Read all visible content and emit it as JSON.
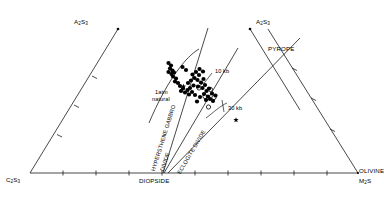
{
  "figure": {
    "type": "ternary-phase-diagram",
    "background": "#ffffff",
    "line_color": "#1a1a1a",
    "point_color": "#000000"
  },
  "apices": {
    "left_top": "A2S3",
    "left_top_html": "A₂S₃",
    "right_top": "A2S3",
    "right_top_html": "A₂S₃",
    "bottom_left": "C2S3",
    "bottom_left_html": "C₂S₃",
    "bottom_right_mineral": "OLIVINE",
    "bottom_right_formula": "M2S",
    "bottom_right_formula_html": "M₂S",
    "bottom_center": "DIOPSIDE"
  },
  "annotations": {
    "pyrope": "PYROPE",
    "divide_hypersthene": "HYPERSTHENE GABBRO",
    "divide_hypersthene_2": "DIVIDE",
    "divide_eclogite": "ECLOGITE  DIVIDE",
    "natural_line1": "1atm",
    "natural_line2": "natural",
    "pressure_10kb": "10 kb",
    "pressure_30kb": "30 kb"
  },
  "chart_data": {
    "type": "scatter",
    "title": "",
    "xlabel": "",
    "ylabel": "",
    "grid": false,
    "legend": "none",
    "filled_points": [
      [
        168.5,
        63.0
      ],
      [
        171.0,
        65.5
      ],
      [
        170.0,
        68.5
      ],
      [
        172.5,
        70.5
      ],
      [
        168.5,
        72.0
      ],
      [
        171.5,
        74.0
      ],
      [
        174.0,
        72.5
      ],
      [
        173.0,
        76.5
      ],
      [
        176.0,
        78.5
      ],
      [
        175.0,
        81.5
      ],
      [
        178.0,
        83.0
      ],
      [
        180.0,
        86.0
      ],
      [
        183.0,
        88.5
      ],
      [
        181.0,
        91.0
      ],
      [
        185.0,
        92.5
      ],
      [
        187.5,
        90.0
      ],
      [
        189.0,
        94.5
      ],
      [
        192.0,
        92.0
      ],
      [
        190.0,
        88.0
      ],
      [
        193.5,
        85.5
      ],
      [
        188.0,
        83.0
      ],
      [
        191.0,
        80.5
      ],
      [
        194.5,
        78.0
      ],
      [
        192.5,
        74.5
      ],
      [
        196.0,
        72.0
      ],
      [
        199.0,
        75.0
      ],
      [
        197.5,
        80.0
      ],
      [
        201.0,
        82.5
      ],
      [
        198.0,
        86.5
      ],
      [
        202.5,
        88.0
      ],
      [
        205.0,
        85.0
      ],
      [
        203.5,
        79.0
      ],
      [
        206.5,
        91.0
      ],
      [
        209.0,
        88.5
      ],
      [
        195.0,
        95.0
      ],
      [
        200.0,
        97.0
      ],
      [
        204.0,
        94.0
      ],
      [
        208.0,
        96.5
      ],
      [
        212.0,
        93.5
      ],
      [
        199.5,
        69.0
      ],
      [
        203.0,
        71.5
      ],
      [
        186.0,
        70.0
      ],
      [
        182.5,
        67.0
      ],
      [
        210.0,
        99.0
      ],
      [
        215.5,
        95.5
      ],
      [
        197.0,
        101.5
      ],
      [
        206.0,
        100.0
      ],
      [
        213.0,
        101.0
      ]
    ],
    "open_points": [
      [
        210.5,
        89.5
      ],
      [
        205.0,
        96.5
      ],
      [
        214.0,
        97.5
      ],
      [
        208.5,
        107.0
      ],
      [
        199.0,
        88.0
      ]
    ],
    "star_points": [
      [
        183.5,
        86.5
      ],
      [
        236.0,
        120.0
      ]
    ],
    "note": "Clustered compositional data within the hypersthene gabbro / eclogite divide region"
  },
  "ticks": {
    "baseline_count": 10,
    "left_edge_count": 3,
    "right_edge_count": 3
  }
}
